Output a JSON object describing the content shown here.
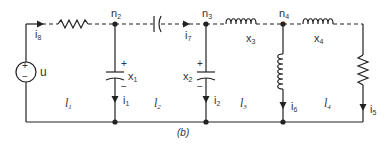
{
  "caption": "(b)",
  "nodes": [
    {
      "id": "n2",
      "base": "n",
      "sub": "2"
    },
    {
      "id": "n3",
      "base": "n",
      "sub": "3"
    },
    {
      "id": "n4",
      "base": "n",
      "sub": "4"
    }
  ],
  "source": {
    "label": "u",
    "plus": "+",
    "minus": "−"
  },
  "currents": [
    {
      "id": "i8",
      "base": "i",
      "sub": "8"
    },
    {
      "id": "i7",
      "base": "i",
      "sub": "7"
    },
    {
      "id": "i1",
      "base": "i",
      "sub": "1"
    },
    {
      "id": "i2",
      "base": "i",
      "sub": "2"
    },
    {
      "id": "i6",
      "base": "i",
      "sub": "6"
    },
    {
      "id": "i5",
      "base": "i",
      "sub": "5"
    }
  ],
  "states": [
    {
      "id": "x1",
      "base": "x",
      "sub": "1"
    },
    {
      "id": "x2",
      "base": "x",
      "sub": "2"
    },
    {
      "id": "x3",
      "base": "x",
      "sub": "3"
    },
    {
      "id": "x4",
      "base": "x",
      "sub": "4"
    }
  ],
  "loops": [
    {
      "id": "l1",
      "base": "l",
      "sub": "1"
    },
    {
      "id": "l2",
      "base": "l",
      "sub": "2"
    },
    {
      "id": "l3",
      "base": "l",
      "sub": "3"
    },
    {
      "id": "l4",
      "base": "l",
      "sub": "4"
    }
  ],
  "polarity": {
    "plus": "+",
    "minus": "−"
  },
  "colors": {
    "wire": "#222222",
    "text": "#333333"
  }
}
